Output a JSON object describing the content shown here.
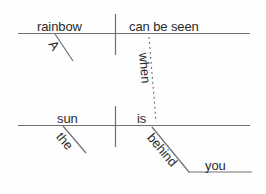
{
  "diagram": {
    "type": "reed-kellogg-sentence-diagram",
    "sentence": "A rainbow can be seen when the sun is behind you.",
    "colors": {
      "background": "#fefefe",
      "line": "#707070",
      "text": "#2b2b2b"
    },
    "clauses": {
      "main": {
        "subject": "rainbow",
        "predicate": "can be seen",
        "subject_modifier": "A"
      },
      "subordinate": {
        "conjunction": "when",
        "subject": "sun",
        "predicate": "is",
        "subject_modifier": "the",
        "preposition": "behind",
        "object_of_preposition": "you"
      }
    },
    "words": {
      "a": "A",
      "rainbow": "rainbow",
      "can_be_seen": "can be seen",
      "when": "when",
      "the": "the",
      "sun": "sun",
      "is": "is",
      "behind": "behind",
      "you": "you"
    }
  }
}
